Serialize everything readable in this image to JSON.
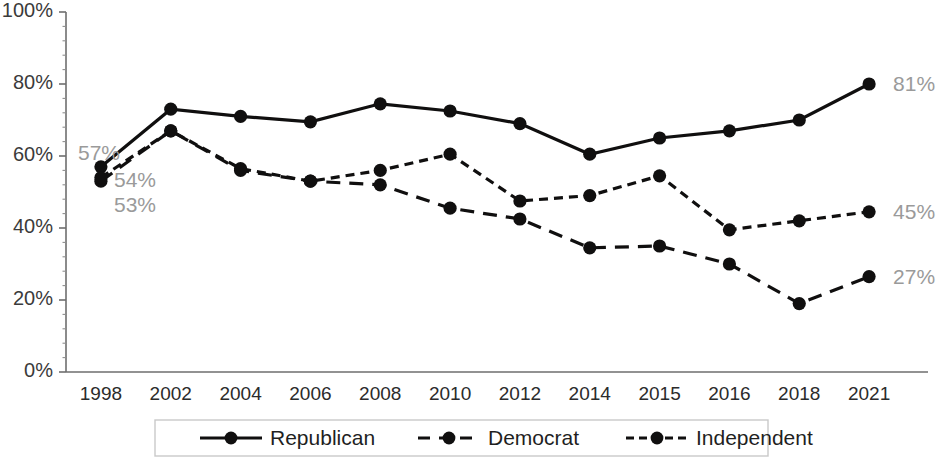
{
  "chart_data": {
    "type": "line",
    "title": "",
    "subtitle": "",
    "xlabel": "",
    "ylabel": "",
    "categories": [
      "1998",
      "2002",
      "2004",
      "2006",
      "2008",
      "2010",
      "2012",
      "2014",
      "2015",
      "2016",
      "2018",
      "2021"
    ],
    "ylim": [
      0,
      100
    ],
    "yticks": [
      "0%",
      "20%",
      "40%",
      "60%",
      "80%",
      "100%"
    ],
    "ytick_values": [
      0,
      20,
      40,
      60,
      80,
      100
    ],
    "grid": false,
    "legend_position": "bottom",
    "series": [
      {
        "name": "Republican",
        "style": "solid",
        "values": [
          57,
          73,
          71,
          69.5,
          74.5,
          72.5,
          69,
          60.5,
          65,
          67,
          70,
          80
        ]
      },
      {
        "name": "Democrat",
        "style": "long-dash",
        "values": [
          53,
          67,
          56,
          53,
          52,
          45.5,
          42.5,
          34.5,
          35,
          30,
          19,
          26.5
        ]
      },
      {
        "name": "Independent",
        "style": "short-dash",
        "values": [
          54,
          67,
          56.5,
          53,
          56,
          60.5,
          47.5,
          49,
          54.5,
          39.5,
          42,
          44.5
        ]
      }
    ],
    "point_labels_left": [
      {
        "text": "57%",
        "series": "Republican",
        "category": "1998",
        "value": 57
      },
      {
        "text": "54%",
        "series": "Independent",
        "category": "1998",
        "value": 54
      },
      {
        "text": "53%",
        "series": "Democrat",
        "category": "1998",
        "value": 53
      }
    ],
    "point_labels_right": [
      {
        "text": "81%",
        "series": "Republican",
        "category": "2021",
        "value": 80
      },
      {
        "text": "45%",
        "series": "Independent",
        "category": "2021",
        "value": 44.5
      },
      {
        "text": "27%",
        "series": "Democrat",
        "category": "2021",
        "value": 26.5
      }
    ],
    "colors": {
      "line": "#100f0f",
      "axis": "#6e6e6e",
      "tick_text": "#2b2b2b",
      "value_label": "#9a9a9a",
      "legend_border": "#c9c9c9",
      "background": "#ffffff"
    }
  },
  "legend": {
    "items": [
      {
        "label": "Republican",
        "style": "solid"
      },
      {
        "label": "Democrat",
        "style": "long-dash"
      },
      {
        "label": "Independent",
        "style": "short-dash"
      }
    ]
  }
}
